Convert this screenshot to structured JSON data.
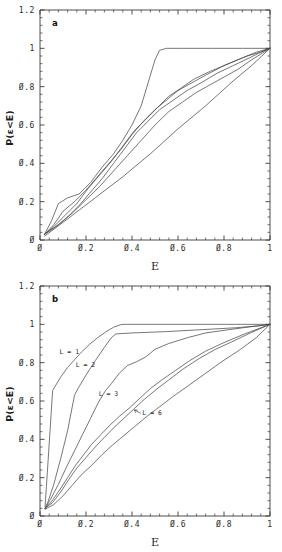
{
  "figure": {
    "title": "",
    "panels": [
      "a",
      "b"
    ]
  },
  "chart_data": [
    {
      "type": "line",
      "panel_tag": "a",
      "title": "",
      "xlabel": "E",
      "ylabel": "P(ε<E)",
      "xlim": [
        0,
        1
      ],
      "ylim": [
        0,
        1.2
      ],
      "xticks": [
        0,
        0.2,
        0.4,
        0.6,
        0.8,
        1
      ],
      "xticklabels": [
        "Ø",
        "Ø.2",
        "Ø.4",
        "Ø.6",
        "Ø.8",
        "1"
      ],
      "yticks": [
        0,
        0.2,
        0.4,
        0.6,
        0.8,
        1,
        1.2
      ],
      "yticklabels": [
        "Ø",
        "Ø.2",
        "Ø.4",
        "Ø.6",
        "Ø.8",
        "1",
        "1.2"
      ],
      "grid": false,
      "legend": "none",
      "minor_ticks_per_interval": 4,
      "series": [
        {
          "name": "curve-1",
          "x": [
            0.02,
            0.05,
            0.08,
            0.12,
            0.17,
            0.22,
            0.27,
            0.32,
            0.36,
            0.4,
            0.44,
            0.47,
            0.5,
            0.52,
            0.55,
            0.62,
            0.75,
            0.88,
            1.0
          ],
          "values": [
            0.03,
            0.1,
            0.19,
            0.22,
            0.24,
            0.3,
            0.38,
            0.45,
            0.52,
            0.6,
            0.7,
            0.82,
            0.94,
            0.99,
            1.0,
            1.0,
            1.0,
            1.0,
            1.0
          ]
        },
        {
          "name": "curve-2",
          "x": [
            0.02,
            0.06,
            0.1,
            0.15,
            0.2,
            0.25,
            0.3,
            0.35,
            0.4,
            0.45,
            0.5,
            0.55,
            0.6,
            0.66,
            0.72,
            0.8,
            0.88,
            0.94,
            1.0
          ],
          "values": [
            0.03,
            0.08,
            0.15,
            0.2,
            0.26,
            0.33,
            0.4,
            0.47,
            0.55,
            0.62,
            0.68,
            0.73,
            0.78,
            0.82,
            0.86,
            0.91,
            0.95,
            0.98,
            1.0
          ]
        },
        {
          "name": "curve-3",
          "x": [
            0.02,
            0.06,
            0.11,
            0.16,
            0.21,
            0.26,
            0.31,
            0.36,
            0.41,
            0.46,
            0.51,
            0.56,
            0.61,
            0.67,
            0.74,
            0.82,
            0.9,
            0.96,
            1.0
          ],
          "values": [
            0.03,
            0.07,
            0.13,
            0.19,
            0.27,
            0.34,
            0.41,
            0.49,
            0.57,
            0.63,
            0.69,
            0.75,
            0.79,
            0.84,
            0.88,
            0.92,
            0.96,
            0.98,
            1.0
          ]
        },
        {
          "name": "curve-4",
          "x": [
            0.02,
            0.07,
            0.12,
            0.17,
            0.22,
            0.27,
            0.32,
            0.37,
            0.42,
            0.47,
            0.52,
            0.58,
            0.64,
            0.7,
            0.77,
            0.84,
            0.91,
            0.96,
            1.0
          ],
          "values": [
            0.03,
            0.07,
            0.12,
            0.18,
            0.25,
            0.32,
            0.4,
            0.48,
            0.56,
            0.62,
            0.68,
            0.73,
            0.78,
            0.82,
            0.87,
            0.91,
            0.95,
            0.98,
            1.0
          ]
        },
        {
          "name": "curve-5",
          "x": [
            0.02,
            0.08,
            0.14,
            0.2,
            0.26,
            0.32,
            0.38,
            0.44,
            0.5,
            0.56,
            0.62,
            0.68,
            0.74,
            0.8,
            0.86,
            0.92,
            0.96,
            1.0
          ],
          "values": [
            0.03,
            0.08,
            0.14,
            0.21,
            0.28,
            0.36,
            0.44,
            0.52,
            0.6,
            0.67,
            0.72,
            0.77,
            0.81,
            0.85,
            0.89,
            0.94,
            0.97,
            1.0
          ]
        },
        {
          "name": "curve-6-diagonal",
          "x": [
            0.02,
            0.12,
            0.24,
            0.36,
            0.48,
            0.6,
            0.72,
            0.84,
            0.92,
            1.0
          ],
          "values": [
            0.02,
            0.11,
            0.22,
            0.33,
            0.45,
            0.58,
            0.7,
            0.83,
            0.91,
            1.0
          ]
        }
      ]
    },
    {
      "type": "line",
      "panel_tag": "b",
      "title": "",
      "xlabel": "E",
      "ylabel": "P(ε<E)",
      "xlim": [
        0,
        1
      ],
      "ylim": [
        0,
        1.2
      ],
      "xticks": [
        0,
        0.2,
        0.4,
        0.6,
        0.8,
        1
      ],
      "xticklabels": [
        "Ø",
        "Ø.2",
        "Ø.4",
        "Ø.6",
        "Ø.8",
        "1"
      ],
      "yticks": [
        0,
        0.2,
        0.4,
        0.6,
        0.8,
        1,
        1.2
      ],
      "yticklabels": [
        "Ø",
        "Ø.2",
        "Ø.4",
        "Ø.6",
        "Ø.8",
        "1",
        "1.2"
      ],
      "grid": false,
      "legend": "inline-annotations",
      "minor_ticks_per_interval": 4,
      "annotations": [
        {
          "text": "L = 1",
          "x": 0.085,
          "y": 0.845
        },
        {
          "text": "L = 2",
          "x": 0.155,
          "y": 0.775
        },
        {
          "text": "L = 3",
          "x": 0.255,
          "y": 0.625
        },
        {
          "text": "L = 6",
          "x": 0.445,
          "y": 0.525
        }
      ],
      "series": [
        {
          "name": "L=1",
          "x": [
            0.022,
            0.028,
            0.055,
            0.06,
            0.09,
            0.12,
            0.15,
            0.18,
            0.215,
            0.25,
            0.285,
            0.32,
            0.35,
            0.365,
            0.5,
            0.7,
            0.85,
            1.0
          ],
          "values": [
            0.05,
            0.155,
            0.655,
            0.665,
            0.725,
            0.775,
            0.815,
            0.855,
            0.895,
            0.93,
            0.96,
            0.985,
            0.998,
            1.0,
            1.0,
            1.0,
            1.0,
            1.0
          ]
        },
        {
          "name": "L=2",
          "x": [
            0.022,
            0.035,
            0.06,
            0.09,
            0.12,
            0.15,
            0.165,
            0.2,
            0.24,
            0.28,
            0.31,
            0.33,
            0.4,
            0.55,
            0.7,
            0.85,
            0.95,
            1.0
          ],
          "values": [
            0.04,
            0.075,
            0.165,
            0.3,
            0.445,
            0.63,
            0.665,
            0.735,
            0.81,
            0.88,
            0.93,
            0.95,
            0.955,
            0.962,
            0.972,
            0.982,
            0.992,
            1.0
          ]
        },
        {
          "name": "L=3",
          "x": [
            0.022,
            0.045,
            0.08,
            0.115,
            0.15,
            0.185,
            0.22,
            0.255,
            0.285,
            0.31,
            0.345,
            0.38,
            0.42,
            0.46,
            0.5,
            0.56,
            0.64,
            0.72,
            0.82,
            0.92,
            1.0
          ],
          "values": [
            0.04,
            0.085,
            0.165,
            0.255,
            0.34,
            0.425,
            0.51,
            0.595,
            0.655,
            0.69,
            0.745,
            0.785,
            0.805,
            0.83,
            0.87,
            0.9,
            0.93,
            0.955,
            0.972,
            0.988,
            1.0
          ]
        },
        {
          "name": "L=4",
          "x": [
            0.022,
            0.05,
            0.085,
            0.12,
            0.155,
            0.19,
            0.225,
            0.265,
            0.305,
            0.345,
            0.39,
            0.435,
            0.48,
            0.53,
            0.59,
            0.65,
            0.72,
            0.8,
            0.89,
            1.0
          ],
          "values": [
            0.04,
            0.075,
            0.135,
            0.2,
            0.265,
            0.32,
            0.375,
            0.425,
            0.475,
            0.52,
            0.565,
            0.615,
            0.665,
            0.71,
            0.76,
            0.81,
            0.86,
            0.905,
            0.95,
            1.0
          ]
        },
        {
          "name": "L=5",
          "x": [
            0.022,
            0.055,
            0.09,
            0.125,
            0.16,
            0.2,
            0.24,
            0.28,
            0.32,
            0.365,
            0.41,
            0.455,
            0.505,
            0.56,
            0.62,
            0.69,
            0.76,
            0.84,
            0.92,
            1.0
          ],
          "values": [
            0.04,
            0.07,
            0.125,
            0.19,
            0.25,
            0.305,
            0.36,
            0.41,
            0.46,
            0.51,
            0.56,
            0.61,
            0.66,
            0.71,
            0.765,
            0.82,
            0.868,
            0.912,
            0.958,
            1.0
          ]
        },
        {
          "name": "L=6",
          "x": [
            0.022,
            0.06,
            0.1,
            0.14,
            0.18,
            0.225,
            0.27,
            0.315,
            0.365,
            0.415,
            0.465,
            0.52,
            0.58,
            0.645,
            0.715,
            0.79,
            0.87,
            0.94,
            1.0
          ],
          "values": [
            0.035,
            0.06,
            0.105,
            0.16,
            0.215,
            0.265,
            0.32,
            0.37,
            0.42,
            0.47,
            0.52,
            0.57,
            0.625,
            0.68,
            0.74,
            0.805,
            0.868,
            0.93,
            1.0
          ]
        }
      ]
    }
  ],
  "panel_a": {
    "tag": "a",
    "xlabel": "E",
    "ylabel": "P(ε<E)",
    "xticklabels": [
      "Ø",
      "Ø.2",
      "Ø.4",
      "Ø.6",
      "Ø.8",
      "1"
    ],
    "yticklabels": [
      "Ø",
      "Ø.2",
      "Ø.4",
      "Ø.6",
      "Ø.8",
      "1",
      "1.2"
    ]
  },
  "panel_b": {
    "tag": "b",
    "xlabel": "E",
    "ylabel": "P(ε<E)",
    "xticklabels": [
      "Ø",
      "Ø.2",
      "Ø.4",
      "Ø.6",
      "Ø.8",
      "1"
    ],
    "yticklabels": [
      "Ø",
      "Ø.2",
      "Ø.4",
      "Ø.6",
      "Ø.8",
      "1",
      "1.2"
    ],
    "labels": [
      "L = 1",
      "L = 2",
      "L = 3",
      "L = 6"
    ]
  },
  "colors": {
    "axis": "#3a3a3a",
    "curve": "#4a4a4a",
    "text": "#2b2b2b",
    "background": "#ffffff"
  }
}
